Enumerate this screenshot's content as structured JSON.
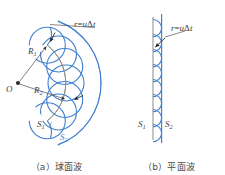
{
  "figure": {
    "background": "#ffffff",
    "wavelet_color": "#3f7fd0",
    "surface_s1_color": "#8c8c8c",
    "label_color": "#3d3d3d"
  },
  "panel_a": {
    "caption": "（a）球面波",
    "labels": {
      "source_point": "O",
      "radius_1": "R",
      "radius_1_sub": "1",
      "radius_2": "R",
      "radius_2_sub": "2",
      "surface_1": "S",
      "surface_1_sub": "1",
      "surface_2": "S",
      "surface_2_sub": "2",
      "wavelet_radius": "r",
      "wavelet_equals": "=",
      "wavelet_speed": "u",
      "wavelet_delta": "Δ",
      "wavelet_time": "t"
    }
  },
  "panel_b": {
    "caption": "（b）平面波",
    "labels": {
      "surface_1": "S",
      "surface_1_sub": "1",
      "surface_2": "S",
      "surface_2_sub": "2",
      "wavelet_radius": "r",
      "wavelet_equals": "=",
      "wavelet_speed": "u",
      "wavelet_delta": "Δ",
      "wavelet_time": "t"
    }
  }
}
